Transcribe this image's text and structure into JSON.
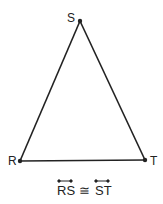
{
  "diagram": {
    "type": "triangle",
    "vertices": [
      {
        "label": "S",
        "x": 80,
        "y": 21
      },
      {
        "label": "R",
        "x": 20,
        "y": 161
      },
      {
        "label": "T",
        "x": 145,
        "y": 160
      }
    ],
    "edges": [
      [
        "R",
        "S"
      ],
      [
        "S",
        "T"
      ],
      [
        "R",
        "T"
      ]
    ],
    "line_color": "#222222"
  },
  "caption": {
    "left": "RS",
    "relation": "≅",
    "right": "ST"
  }
}
